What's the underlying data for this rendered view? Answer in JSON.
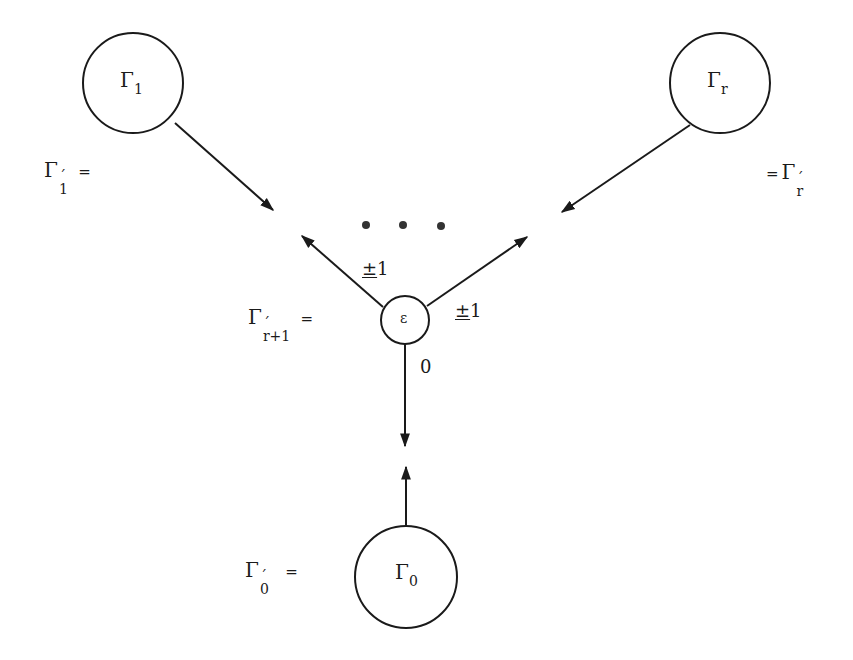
{
  "diagram": {
    "nodes": {
      "gamma1": {
        "symbol": "Γ",
        "sub": "1"
      },
      "gammar": {
        "symbol": "Γ",
        "sub": "r"
      },
      "epsilon": {
        "symbol": "ε"
      },
      "gamma0": {
        "symbol": "Γ",
        "sub": "0"
      }
    },
    "equations": {
      "gamma1_prime": {
        "symbol": "Γ",
        "prime": "´",
        "sub": "1",
        "eq": "="
      },
      "gammar_prime": {
        "eq": "=",
        "symbol": "Γ",
        "prime": "´",
        "sub": "r"
      },
      "gammar1_prime": {
        "symbol": "Γ",
        "prime": "´",
        "sub": "r+1",
        "eq": "="
      },
      "gamma0_prime": {
        "symbol": "Γ",
        "prime": "´",
        "sub": "0",
        "eq": "="
      }
    },
    "edges": {
      "left_label": {
        "pm": "±",
        "value": "1"
      },
      "right_label": {
        "pm": "±",
        "value": "1"
      },
      "down_label": "0"
    },
    "ellipsis": "• • •",
    "colors": {
      "stroke": "#1a1a1a",
      "background": "#ffffff"
    }
  }
}
